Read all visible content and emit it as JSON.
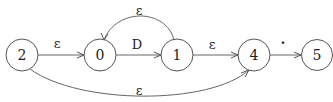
{
  "diagram": {
    "type": "NFA state transition diagram",
    "nodes": [
      {
        "id": "2",
        "label": "2",
        "cx": 22,
        "cy": 55
      },
      {
        "id": "0",
        "label": "0",
        "cx": 100,
        "cy": 55
      },
      {
        "id": "1",
        "label": "1",
        "cx": 177,
        "cy": 55
      },
      {
        "id": "4",
        "label": "4",
        "cx": 254,
        "cy": 55
      },
      {
        "id": "5",
        "label": "5",
        "cx": 317,
        "cy": 55
      }
    ],
    "edges": [
      {
        "from": "2",
        "to": "0",
        "label": "ε"
      },
      {
        "from": "0",
        "to": "1",
        "label": "D"
      },
      {
        "from": "1",
        "to": "0",
        "label": "ε"
      },
      {
        "from": "1",
        "to": "4",
        "label": "ε"
      },
      {
        "from": "4",
        "to": "5",
        "label": "·"
      },
      {
        "from": "2",
        "to": "4",
        "label": "ε"
      }
    ]
  }
}
